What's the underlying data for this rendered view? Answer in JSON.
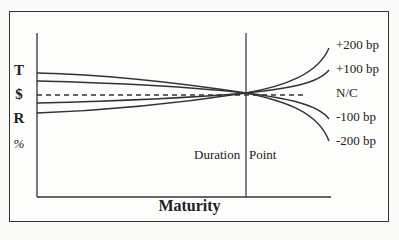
{
  "diagram": {
    "y_axis_letters": [
      "T",
      "$",
      "R",
      "%"
    ],
    "x_axis_label": "Maturity",
    "duration_label_left": "Duration",
    "duration_label_right": "Point",
    "curves": [
      {
        "label": "+200 bp",
        "style": "solid"
      },
      {
        "label": "+100 bp",
        "style": "solid"
      },
      {
        "label": "N/C",
        "style": "dashed"
      },
      {
        "label": "-100 bp",
        "style": "solid"
      },
      {
        "label": "-200 bp",
        "style": "solid"
      }
    ]
  }
}
